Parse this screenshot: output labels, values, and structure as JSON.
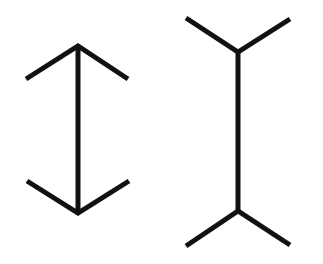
{
  "diagram": {
    "type": "muller-lyer-illusion",
    "background": "#ffffff",
    "stroke_color": "#111111",
    "figures": [
      {
        "name": "arrowheads-outward",
        "shaft": {
          "x1": 78,
          "y1": 46,
          "x2": 78,
          "y2": 213
        },
        "top_fins": "26,79 78,46 128,79",
        "bottom_fins": "27,181 78,213 129,181"
      },
      {
        "name": "arrowheads-inward",
        "shaft": {
          "x1": 238,
          "y1": 52,
          "x2": 238,
          "y2": 211
        },
        "top_fins": "186,18 238,52 290,19",
        "bottom_fins": "186,246 238,211 290,245"
      }
    ]
  }
}
